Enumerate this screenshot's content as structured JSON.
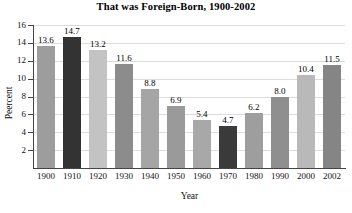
{
  "chart_data": {
    "type": "bar",
    "title": "That was Foreign-Born, 1900-2002",
    "xlabel": "Year",
    "ylabel": "Peercent",
    "categories": [
      "1900",
      "1910",
      "1920",
      "1930",
      "1940",
      "1950",
      "1960",
      "1970",
      "1980",
      "1990",
      "2000",
      "2002"
    ],
    "values": [
      13.6,
      14.7,
      13.2,
      11.6,
      8.8,
      6.9,
      5.4,
      4.7,
      6.2,
      8.0,
      10.4,
      11.5
    ],
    "value_labels": [
      "13.6",
      "14.7",
      "13.2",
      "11.6",
      "8.8",
      "6.9",
      "5.4",
      "4.7",
      "6.2",
      "8.0",
      "10.4",
      "11.5"
    ],
    "bar_colors": [
      "#9d9d9d",
      "#333333",
      "#c3c3c3",
      "#8c8c8c",
      "#a5a5a5",
      "#9a9a9a",
      "#a8a8a8",
      "#3a3a3a",
      "#9e9e9e",
      "#8f8f8f",
      "#b9b9b9",
      "#858585"
    ],
    "ylim": [
      0,
      16
    ],
    "yticks": [
      "2",
      "4",
      "6",
      "8",
      "10",
      "12",
      "14",
      "16"
    ],
    "ytick_values": [
      2,
      4,
      6,
      8,
      10,
      12,
      14,
      16
    ],
    "grid": true,
    "legend": "none",
    "gridline_color": "#dcdcdc",
    "axis_color": "#444444"
  }
}
